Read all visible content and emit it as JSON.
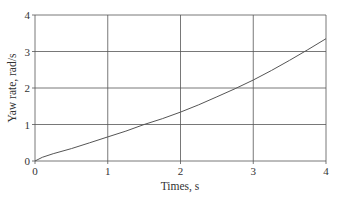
{
  "chart_data": {
    "type": "line",
    "title": "",
    "xlabel": "Times, s",
    "ylabel": "Yaw rate, rad/s",
    "xlim": [
      0,
      4
    ],
    "ylim": [
      0,
      4
    ],
    "xticks": [
      "0",
      "1",
      "2",
      "3",
      "4"
    ],
    "yticks": [
      "0",
      "1",
      "2",
      "3",
      "4"
    ],
    "grid": true,
    "legend": null,
    "series": [
      {
        "name": "Yaw rate",
        "color": "#555555",
        "x": [
          0,
          0.1,
          0.25,
          0.5,
          0.75,
          1.0,
          1.25,
          1.5,
          1.75,
          2.0,
          2.25,
          2.5,
          2.75,
          3.0,
          3.25,
          3.5,
          3.75,
          4.0
        ],
        "y": [
          0,
          0.1,
          0.2,
          0.34,
          0.5,
          0.66,
          0.82,
          1.0,
          1.16,
          1.34,
          1.54,
          1.76,
          1.98,
          2.22,
          2.48,
          2.76,
          3.05,
          3.35
        ]
      }
    ]
  },
  "colors": {
    "grid": "#555555",
    "curve": "#555555",
    "text": "#333333",
    "background": "#ffffff"
  }
}
